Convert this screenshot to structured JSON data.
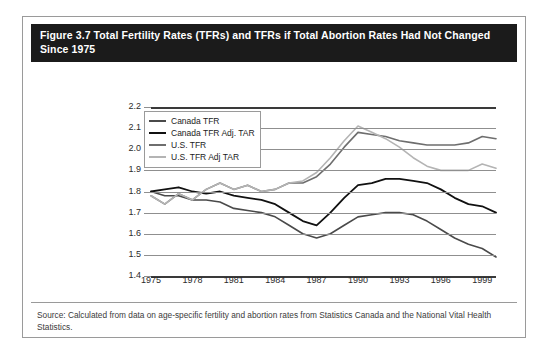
{
  "figure": {
    "title": "Figure 3.7 Total Fertility Rates (TFRs) and TFRs if Total Abortion Rates Had Not Changed Since 1975",
    "source": "Source: Calculated from data on age-specific fertility and abortion rates from Statistics Canada and the National Vital Health Statistics."
  },
  "colors": {
    "title_bar": "#1b1b1b",
    "title_text": "#ffffff",
    "card_border": "#9a9a9a",
    "grid": "#8f8f8f",
    "canada_tfr": "#4a4a4a",
    "canada_tfr_adj": "#111111",
    "us_tfr": "#6e6e6e",
    "us_tfr_adj": "#b4b4b4"
  },
  "chart_data": {
    "type": "line",
    "title": "Figure 3.7 Total Fertility Rates (TFRs) and TFRs if Total Abortion Rates Had Not Changed Since 1975",
    "xlabel": "",
    "ylabel": "",
    "xlim": [
      1975,
      2000
    ],
    "ylim": [
      1.4,
      2.2
    ],
    "ytick_labels": [
      "2.2",
      "2.1",
      "2.0",
      "1.9",
      "1.8",
      "1.7",
      "1.6",
      "1.5",
      "1.4"
    ],
    "ytick_values": [
      2.2,
      2.1,
      2.0,
      1.9,
      1.8,
      1.7,
      1.6,
      1.5,
      1.4
    ],
    "xtick_labels": [
      "1975",
      "1978",
      "1981",
      "1984",
      "1987",
      "1990",
      "1993",
      "1996",
      "1999"
    ],
    "xtick_values": [
      1975,
      1978,
      1981,
      1984,
      1987,
      1990,
      1993,
      1996,
      1999
    ],
    "grid": true,
    "legend_position": "top-left-inside",
    "x": [
      1975,
      1976,
      1977,
      1978,
      1979,
      1980,
      1981,
      1982,
      1983,
      1984,
      1985,
      1986,
      1987,
      1988,
      1989,
      1990,
      1991,
      1992,
      1993,
      1994,
      1995,
      1996,
      1997,
      1998,
      1999,
      2000
    ],
    "series": [
      {
        "name": "Canada TFR",
        "color": "#4a4a4a",
        "width": 1.6,
        "values": [
          1.8,
          1.78,
          1.78,
          1.76,
          1.76,
          1.75,
          1.72,
          1.71,
          1.7,
          1.68,
          1.64,
          1.6,
          1.58,
          1.6,
          1.64,
          1.68,
          1.69,
          1.7,
          1.7,
          1.69,
          1.66,
          1.62,
          1.58,
          1.55,
          1.53,
          1.49
        ]
      },
      {
        "name": "Canada TFR Adj. TAR",
        "color": "#111111",
        "width": 1.8,
        "values": [
          1.8,
          1.81,
          1.82,
          1.8,
          1.79,
          1.8,
          1.78,
          1.77,
          1.76,
          1.74,
          1.7,
          1.66,
          1.64,
          1.7,
          1.77,
          1.83,
          1.84,
          1.86,
          1.86,
          1.85,
          1.84,
          1.81,
          1.77,
          1.74,
          1.73,
          1.7
        ]
      },
      {
        "name": "U.S. TFR",
        "color": "#6e6e6e",
        "width": 1.6,
        "values": [
          1.78,
          1.74,
          1.79,
          1.76,
          1.81,
          1.84,
          1.81,
          1.83,
          1.8,
          1.81,
          1.84,
          1.84,
          1.87,
          1.93,
          2.01,
          2.08,
          2.07,
          2.06,
          2.04,
          2.03,
          2.02,
          2.02,
          2.02,
          2.03,
          2.06,
          2.05
        ]
      },
      {
        "name": "U.S. TFR Adj TAR",
        "color": "#b4b4b4",
        "width": 1.6,
        "values": [
          1.78,
          1.74,
          1.79,
          1.76,
          1.81,
          1.84,
          1.81,
          1.83,
          1.8,
          1.81,
          1.84,
          1.85,
          1.89,
          1.96,
          2.04,
          2.11,
          2.08,
          2.05,
          2.01,
          1.96,
          1.92,
          1.9,
          1.9,
          1.9,
          1.93,
          1.91
        ]
      }
    ]
  },
  "legend": {
    "items": [
      {
        "label": "Canada TFR"
      },
      {
        "label": "Canada TFR Adj. TAR"
      },
      {
        "label": "U.S. TFR"
      },
      {
        "label": "U.S. TFR Adj TAR"
      }
    ]
  }
}
